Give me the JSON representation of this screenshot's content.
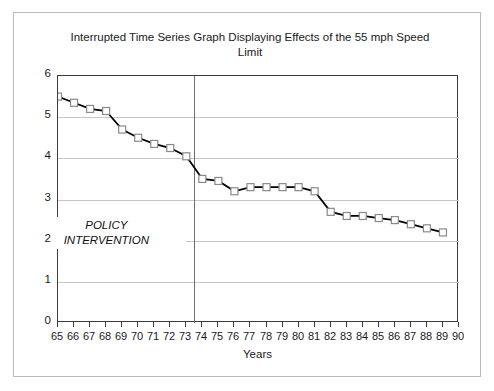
{
  "chart_data": {
    "type": "line",
    "title": "Interrupted Time Series Graph Displaying Effects of the 55 mph Speed Limit",
    "xlabel": "Years",
    "ylabel": "Deaths Per 100 Million Miles",
    "xlim": [
      65,
      90
    ],
    "ylim": [
      0,
      6
    ],
    "xticks": [
      65,
      66,
      67,
      68,
      69,
      70,
      71,
      72,
      73,
      74,
      75,
      76,
      77,
      78,
      79,
      80,
      81,
      82,
      83,
      84,
      85,
      86,
      87,
      88,
      89,
      90
    ],
    "yticks": [
      0,
      1,
      2,
      3,
      4,
      5,
      6
    ],
    "grid": true,
    "legend": "none",
    "marker": "open-square",
    "line_color": "#000000",
    "marker_edge_color": "#8a8a8a",
    "grid_color": "#c6c6c6",
    "x": [
      65,
      66,
      67,
      68,
      69,
      70,
      71,
      72,
      73,
      74,
      75,
      76,
      77,
      78,
      79,
      80,
      81,
      82,
      83,
      84,
      85,
      86,
      87,
      88,
      89
    ],
    "values": [
      5.5,
      5.35,
      5.2,
      5.15,
      4.7,
      4.5,
      4.35,
      4.25,
      4.05,
      3.5,
      3.45,
      3.2,
      3.3,
      3.3,
      3.3,
      3.3,
      3.2,
      2.7,
      2.6,
      2.6,
      2.55,
      2.5,
      2.4,
      2.3,
      2.2
    ],
    "series": [
      {
        "name": "Deaths Per 100 Million Miles",
        "values": [
          5.5,
          5.35,
          5.2,
          5.15,
          4.7,
          4.5,
          4.35,
          4.25,
          4.05,
          3.5,
          3.45,
          3.2,
          3.3,
          3.3,
          3.3,
          3.3,
          3.2,
          2.7,
          2.6,
          2.6,
          2.55,
          2.5,
          2.4,
          2.3,
          2.2
        ]
      }
    ],
    "annotations": [
      {
        "name": "policy-intervention",
        "text_line_1": "POLICY",
        "text_line_2": "INTERVENTION",
        "x": 73.5,
        "style": "vertical-line"
      }
    ]
  }
}
